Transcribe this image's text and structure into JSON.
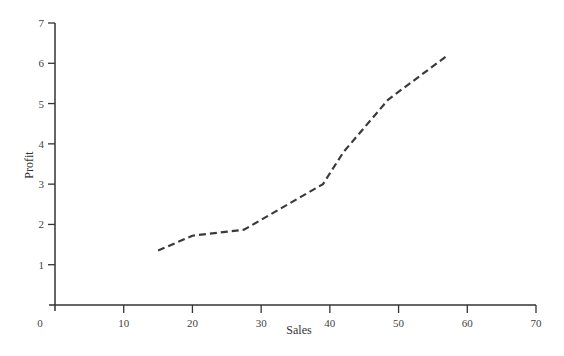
{
  "chart_data": {
    "type": "line",
    "title": "",
    "xlabel": "Sales",
    "ylabel": "Profit",
    "xlim": [
      0,
      70
    ],
    "ylim": [
      0,
      7
    ],
    "x_ticks": [
      0,
      10,
      20,
      30,
      40,
      50,
      60,
      70
    ],
    "y_ticks": [
      1,
      2,
      3,
      4,
      5,
      6,
      7
    ],
    "grid": false,
    "legend": null,
    "series": [
      {
        "name": "Profit vs Sales",
        "style": "dashed",
        "color": "#3a3a3a",
        "x": [
          15,
          20,
          27.5,
          39,
          42,
          48.5,
          57
        ],
        "y": [
          1.35,
          1.72,
          1.87,
          3.0,
          3.8,
          5.1,
          6.18
        ]
      }
    ]
  },
  "colors": {
    "axis": "#333333",
    "line": "#3a3a3a",
    "background": "#ffffff"
  }
}
